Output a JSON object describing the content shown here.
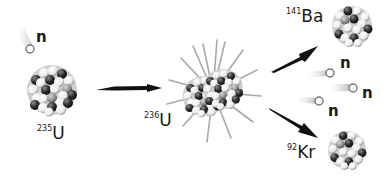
{
  "diagram": {
    "type": "nuclear-fission",
    "colors": {
      "background": "#ffffff",
      "ink": "#1a1a1a",
      "nucleon_dark": "#2a2a2a",
      "nucleon_mid": "#8a8a8a",
      "nucleon_light": "#f4f4f4",
      "neutron_outline": "#777777",
      "trail": "#bdbdbd"
    },
    "stages": [
      {
        "id": "u235",
        "isotope_mass": "235",
        "symbol": "U",
        "description": "target nucleus"
      },
      {
        "id": "u236",
        "isotope_mass": "236",
        "symbol": "U",
        "description": "excited compound nucleus"
      },
      {
        "id": "ba141",
        "isotope_mass": "141",
        "symbol": "Ba",
        "description": "fission fragment"
      },
      {
        "id": "kr92",
        "isotope_mass": "92",
        "symbol": "Kr",
        "description": "fission fragment"
      }
    ],
    "neutrons": {
      "incoming": {
        "label": "n"
      },
      "released": [
        {
          "label": "n"
        },
        {
          "label": "n"
        },
        {
          "label": "n"
        }
      ]
    },
    "arrows": [
      {
        "from": "u235",
        "to": "u236"
      },
      {
        "from": "u236",
        "to": "ba141"
      },
      {
        "from": "u236",
        "to": "kr92"
      }
    ]
  }
}
